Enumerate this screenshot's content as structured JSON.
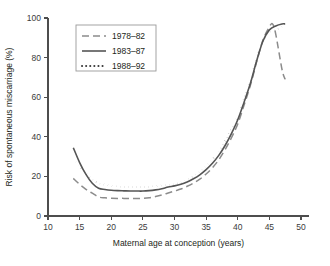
{
  "figure": {
    "title_partial": "",
    "background": "#ffffff"
  },
  "axis": {
    "x_title": "Maternal age at conception (years)",
    "y_title": "Risk of spontaneous miscarriage (%)",
    "x_ticks": [
      "10",
      "15",
      "20",
      "25",
      "30",
      "35",
      "40",
      "45",
      "50"
    ],
    "y_ticks": [
      "0",
      "20",
      "40",
      "60",
      "80",
      "100"
    ]
  },
  "legend": {
    "items": [
      {
        "label": "1978–82",
        "style": "dashed",
        "color": "#8c8c8c"
      },
      {
        "label": "1983–87",
        "style": "solid",
        "color": "#555555"
      },
      {
        "label": "1988–92",
        "style": "dotted",
        "color": "#3a3a3a"
      }
    ]
  },
  "chart_data": {
    "type": "line",
    "xlabel": "Maternal age at conception (years)",
    "ylabel": "Risk of spontaneous miscarriage (%)",
    "xlim": [
      10,
      50
    ],
    "ylim": [
      0,
      100
    ],
    "xticks": [
      10,
      15,
      20,
      25,
      30,
      35,
      40,
      45,
      50
    ],
    "yticks": [
      0,
      20,
      40,
      60,
      80,
      100
    ],
    "grid": false,
    "legend_position": "upper-left",
    "units": "percent",
    "series": [
      {
        "name": "1978–82",
        "style": "dashed",
        "color": "#8c8c8c",
        "x": [
          14,
          15,
          16,
          17,
          18,
          19,
          20,
          21,
          22,
          23,
          24,
          25,
          26,
          27,
          28,
          29,
          30,
          31,
          32,
          33,
          34,
          35,
          36,
          37,
          38,
          39,
          40,
          41,
          42,
          43,
          44,
          45,
          45.5,
          46,
          47,
          47.5
        ],
        "y": [
          19.0,
          16.0,
          13.5,
          11.5,
          9.6,
          9.2,
          9.0,
          8.9,
          8.9,
          8.8,
          8.8,
          8.9,
          9.2,
          9.8,
          10.6,
          11.6,
          12.6,
          13.6,
          15.0,
          16.6,
          18.6,
          21.2,
          24.4,
          28.4,
          33.5,
          39.5,
          46.5,
          56.0,
          66.0,
          78.0,
          89.0,
          95.5,
          97.0,
          92.0,
          74.0,
          69.0
        ]
      },
      {
        "name": "1983–87",
        "style": "solid",
        "color": "#555555",
        "x": [
          14,
          15,
          16,
          17,
          18,
          19,
          20,
          21,
          22,
          23,
          24,
          25,
          26,
          27,
          28,
          29,
          30,
          31,
          32,
          33,
          34,
          35,
          36,
          37,
          38,
          39,
          40,
          41,
          42,
          43,
          44,
          45,
          46,
          47,
          47.5
        ],
        "y": [
          34.5,
          27.0,
          21.0,
          16.5,
          14.0,
          13.4,
          13.0,
          12.8,
          12.7,
          12.6,
          12.6,
          12.6,
          12.8,
          13.2,
          13.8,
          14.6,
          15.2,
          16.0,
          17.2,
          18.8,
          20.8,
          23.4,
          26.6,
          30.6,
          35.6,
          41.6,
          48.6,
          57.5,
          67.0,
          78.5,
          88.5,
          94.0,
          96.0,
          97.0,
          97.0
        ]
      },
      {
        "name": "1988–92",
        "style": "dotted",
        "color": "#3a3a3a",
        "x": [
          14,
          15,
          16,
          17,
          18,
          19,
          20,
          21,
          22,
          23,
          24,
          25,
          26,
          27,
          28,
          29,
          30,
          31,
          32,
          33,
          34,
          35,
          36,
          37,
          38,
          39,
          40,
          41,
          42,
          43,
          44,
          45,
          46,
          47,
          47.5
        ],
        "y": [
          29.0,
          25.0,
          21.5,
          18.5,
          16.6,
          15.8,
          15.2,
          14.9,
          14.7,
          14.6,
          14.6,
          14.6,
          14.7,
          15.0,
          15.4,
          15.6,
          16.0,
          17.0,
          18.4,
          20.2,
          22.4,
          25.2,
          28.6,
          32.8,
          38.0,
          44.0,
          50.5,
          59.0,
          68.5,
          79.5,
          88.0,
          92.5,
          94.0,
          95.5,
          96.0
        ]
      }
    ]
  },
  "geometry": {
    "plot_left": 48,
    "plot_right": 301,
    "plot_top": 18,
    "plot_bottom": 216,
    "legend_box": {
      "x": 76,
      "y": 25,
      "w": 80,
      "h": 46
    }
  }
}
